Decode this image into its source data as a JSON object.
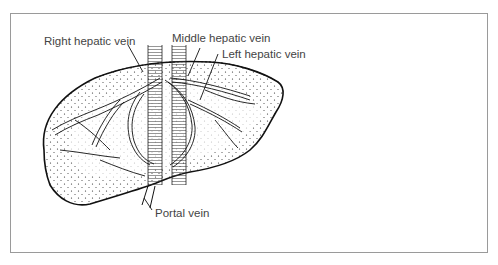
{
  "figure": {
    "labels": [
      {
        "id": "right-hepatic-vein",
        "text": "Right hepatic vein"
      },
      {
        "id": "middle-hepatic-vein",
        "text": "Middle hepatic vein"
      },
      {
        "id": "left-hepatic-vein",
        "text": "Left hepatic vein"
      },
      {
        "id": "portal-vein",
        "text": "Portal vein"
      }
    ],
    "colors": {
      "line": "#111111",
      "frame": "#9a9a9a",
      "label": "#444444",
      "background": "#ffffff"
    }
  }
}
